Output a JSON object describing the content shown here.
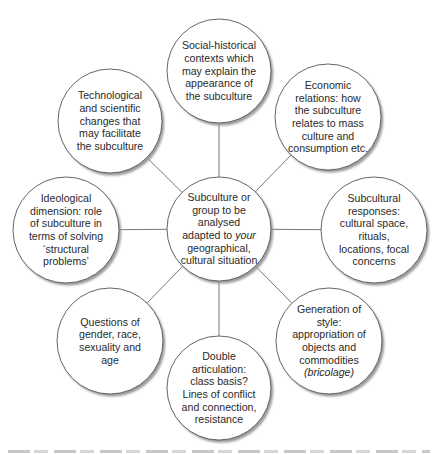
{
  "diagram": {
    "type": "mind-map",
    "center": {
      "id": "center",
      "lines": [
        "Subculture or",
        "group to be",
        "analysed",
        "adapted to |your|",
        "geographical,",
        "cultural situation"
      ]
    },
    "nodes": [
      {
        "id": "social-historical",
        "position": "top",
        "lines": [
          "Social-historical",
          "contexts which",
          "may explain the",
          "appearance of",
          "the subculture"
        ]
      },
      {
        "id": "economic-relations",
        "position": "top-right",
        "lines": [
          "Economic",
          "relations: how",
          "the subculture",
          "relates to mass",
          "culture and",
          "consumption etc."
        ]
      },
      {
        "id": "subcultural-responses",
        "position": "right",
        "lines": [
          "Subcultural",
          "responses:",
          "cultural space,",
          "rituals,",
          "locations, focal",
          "concerns"
        ]
      },
      {
        "id": "generation-of-style",
        "position": "bottom-right",
        "lines": [
          "Generation of",
          "style:",
          "appropriation of",
          "objects and",
          "commodities",
          "|(bricolage)|"
        ]
      },
      {
        "id": "double-articulation",
        "position": "bottom",
        "lines": [
          "Double",
          "articulation:",
          "class basis?",
          "Lines of conflict",
          "and connection,",
          "resistance"
        ]
      },
      {
        "id": "questions-of-gender",
        "position": "bottom-left",
        "lines": [
          "Questions of",
          "gender, race,",
          "sexuality and",
          "age"
        ]
      },
      {
        "id": "ideological-dimension",
        "position": "left",
        "lines": [
          "Ideological",
          "dimension: role",
          "of subculture in",
          "terms of solving",
          "‘structural",
          "problems’"
        ]
      },
      {
        "id": "technological-changes",
        "position": "top-left",
        "lines": [
          "Technological",
          "and scientific",
          "changes that",
          "may facilitate",
          "the subculture"
        ]
      }
    ],
    "colors": {
      "circle_fill": "#ffffff",
      "circle_stroke": "#555555",
      "shadow": "#9a9a9a",
      "connector": "#555555",
      "text": "#2a2a2a"
    }
  }
}
